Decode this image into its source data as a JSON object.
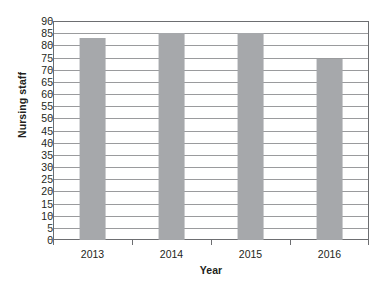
{
  "chart_data": {
    "type": "bar",
    "title": "",
    "subtitle": "",
    "xlabel": "Year",
    "ylabel": "Nursing staff",
    "categories": [
      "2013",
      "2014",
      "2015",
      "2016"
    ],
    "values": [
      83,
      85,
      85,
      74.5
    ],
    "series": [
      {
        "name": "Nursing staff",
        "values": [
          83,
          85,
          85,
          74.5
        ]
      }
    ],
    "ylim": [
      0,
      90
    ],
    "ytick_step": 5,
    "ytick_labels": [
      "0",
      "5",
      "10",
      "15",
      "20",
      "25",
      "30",
      "35",
      "40",
      "45",
      "50",
      "55",
      "60",
      "65",
      "70",
      "75",
      "80",
      "85",
      "90"
    ],
    "xtick_labels": [
      "2013",
      "2014",
      "2015",
      "2016"
    ],
    "grid": true,
    "grid_axis": "y",
    "legend": false,
    "legend_position": "none",
    "annotations": [],
    "colors": {
      "bar_fill": "#a6a8ab",
      "gridline": "#9a9b9d",
      "axis_line": "#6d6e71",
      "text": "#231f20",
      "background": "#ffffff"
    }
  }
}
